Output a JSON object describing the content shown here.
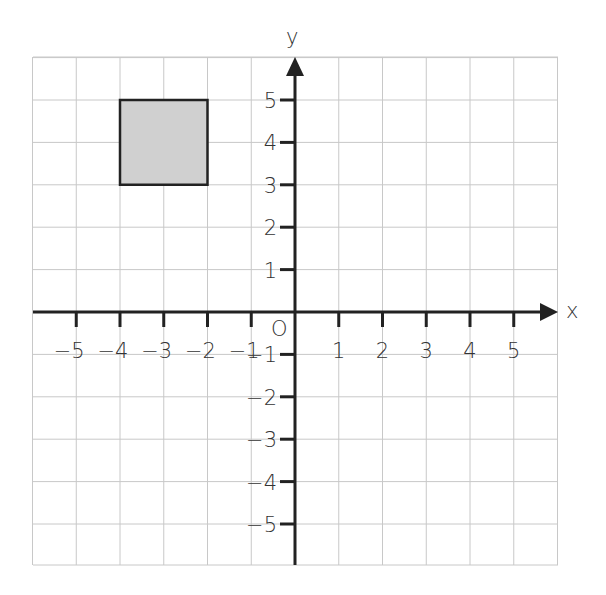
{
  "diagram": {
    "type": "coordinate-plane",
    "axes": {
      "x_label": "x",
      "y_label": "y",
      "origin_label": "O"
    },
    "x_ticks": [
      "-5",
      "-4",
      "-3",
      "-2",
      "-1",
      "1",
      "2",
      "3",
      "4",
      "5"
    ],
    "y_ticks": [
      "5",
      "4",
      "3",
      "2",
      "1",
      "-1",
      "-2",
      "-3",
      "-4",
      "-5"
    ],
    "shape": {
      "type": "square",
      "vertices": [
        [
          -4,
          3
        ],
        [
          -2,
          3
        ],
        [
          -2,
          5
        ],
        [
          -4,
          5
        ]
      ],
      "fill": "#d0d0d0"
    },
    "colors": {
      "grid": "#c8c8c8",
      "axis": "#222222"
    }
  }
}
